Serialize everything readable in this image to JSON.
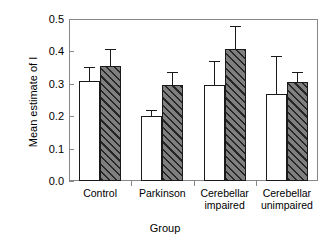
{
  "chart_data": {
    "type": "bar",
    "title": "",
    "xlabel": "Group",
    "ylabel": "Mean estimate of I",
    "categories": [
      "Control",
      "Parkinson",
      "Cerebellar impaired",
      "Cerebellar unimpaired"
    ],
    "category_lines": [
      {
        "line1": "Control",
        "line2": ""
      },
      {
        "line1": "Parkinson",
        "line2": ""
      },
      {
        "line1": "Cerebellar",
        "line2": "impaired"
      },
      {
        "line1": "Cerebellar",
        "line2": "unimpaired"
      }
    ],
    "ylim": [
      0.0,
      0.5
    ],
    "ytick_values": [
      0.0,
      0.1,
      0.2,
      0.3,
      0.4,
      0.5
    ],
    "ytick_labels": [
      "0.0",
      "0.1",
      "0.2",
      "0.3",
      "0.4",
      "0.5"
    ],
    "grid": false,
    "legend": "none",
    "series": [
      {
        "name": "white",
        "fill": "#ffffff",
        "values": [
          0.31,
          0.2,
          0.296,
          0.27
        ],
        "errors": [
          0.04,
          0.015,
          0.072,
          0.112
        ]
      },
      {
        "name": "hatched",
        "fill": "#7f7f7f",
        "values": [
          0.355,
          0.296,
          0.407,
          0.305
        ],
        "errors": [
          0.05,
          0.037,
          0.068,
          0.028
        ]
      }
    ],
    "colors": {
      "axis": "#888888",
      "bar_outline": "#1a1a1a",
      "hatch_fill": "#7f7f7f",
      "hatch_line": "#262626",
      "background": "#ffffff"
    }
  }
}
